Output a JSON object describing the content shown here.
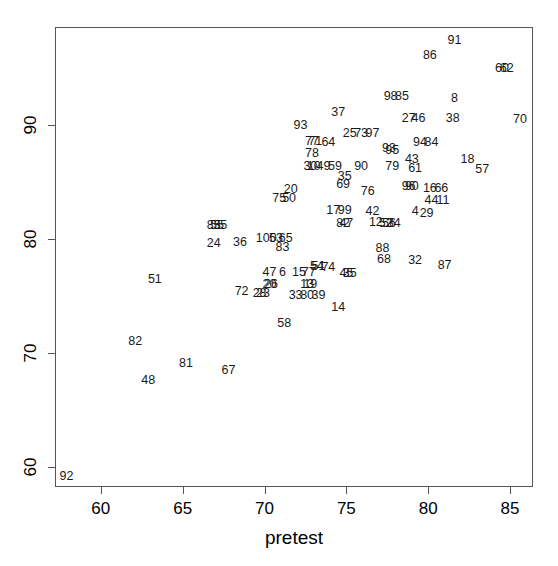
{
  "chart_data": {
    "type": "scatter",
    "title": "",
    "subtitle": "",
    "xlabel": "pretest",
    "ylabel": "",
    "xlim": [
      57.2,
      86.4
    ],
    "ylim": [
      58.2,
      98.6
    ],
    "xticks": [
      60,
      65,
      70,
      75,
      80,
      85
    ],
    "yticks": [
      60,
      70,
      80,
      90
    ],
    "grid": false,
    "legend": null,
    "point_style": "text-labels",
    "annotation_note": "Each data point is drawn as its case-number label rather than a plotting symbol; several labels overlap where points coincide.",
    "points": [
      {
        "label": "91",
        "x": 81.6,
        "y": 97.5
      },
      {
        "label": "86",
        "x": 80.1,
        "y": 96.1
      },
      {
        "label": "60",
        "x": 84.5,
        "y": 95.0
      },
      {
        "label": "62",
        "x": 84.8,
        "y": 95.0
      },
      {
        "label": "98",
        "x": 77.7,
        "y": 92.5
      },
      {
        "label": "85",
        "x": 78.4,
        "y": 92.5
      },
      {
        "label": "8",
        "x": 81.6,
        "y": 92.4
      },
      {
        "label": "27",
        "x": 78.8,
        "y": 90.6
      },
      {
        "label": "46",
        "x": 79.4,
        "y": 90.6
      },
      {
        "label": "38",
        "x": 81.5,
        "y": 90.6
      },
      {
        "label": "70",
        "x": 85.6,
        "y": 90.5
      },
      {
        "label": "37",
        "x": 74.5,
        "y": 91.1
      },
      {
        "label": "93",
        "x": 72.2,
        "y": 90.0
      },
      {
        "label": "25",
        "x": 75.2,
        "y": 89.3
      },
      {
        "label": "73",
        "x": 75.9,
        "y": 89.3
      },
      {
        "label": "97",
        "x": 76.6,
        "y": 89.3
      },
      {
        "label": "94",
        "x": 79.5,
        "y": 88.5
      },
      {
        "label": "84",
        "x": 80.2,
        "y": 88.5
      },
      {
        "label": "64",
        "x": 73.9,
        "y": 88.5
      },
      {
        "label": "77",
        "x": 72.9,
        "y": 88.6
      },
      {
        "label": "71",
        "x": 73.1,
        "y": 88.6
      },
      {
        "label": "93b",
        "x": 77.6,
        "y": 88.0
      },
      {
        "label": "95",
        "x": 77.8,
        "y": 87.8
      },
      {
        "label": "78",
        "x": 72.9,
        "y": 87.5
      },
      {
        "label": "43",
        "x": 79.0,
        "y": 87.0
      },
      {
        "label": "18",
        "x": 82.4,
        "y": 87.0
      },
      {
        "label": "30",
        "x": 72.8,
        "y": 86.4
      },
      {
        "label": "10",
        "x": 73.0,
        "y": 86.4
      },
      {
        "label": "49",
        "x": 73.6,
        "y": 86.4
      },
      {
        "label": "59",
        "x": 74.3,
        "y": 86.4
      },
      {
        "label": "90",
        "x": 75.9,
        "y": 86.4
      },
      {
        "label": "79",
        "x": 77.8,
        "y": 86.4
      },
      {
        "label": "61",
        "x": 79.2,
        "y": 86.2
      },
      {
        "label": "57",
        "x": 83.3,
        "y": 86.1
      },
      {
        "label": "35",
        "x": 74.9,
        "y": 85.5
      },
      {
        "label": "69",
        "x": 74.8,
        "y": 84.8
      },
      {
        "label": "96",
        "x": 78.8,
        "y": 84.6
      },
      {
        "label": "90b",
        "x": 79.0,
        "y": 84.6
      },
      {
        "label": "16",
        "x": 80.1,
        "y": 84.5
      },
      {
        "label": "66",
        "x": 80.8,
        "y": 84.5
      },
      {
        "label": "20",
        "x": 71.6,
        "y": 84.4
      },
      {
        "label": "76",
        "x": 76.3,
        "y": 84.2
      },
      {
        "label": "75",
        "x": 70.9,
        "y": 83.6
      },
      {
        "label": "50",
        "x": 71.5,
        "y": 83.6
      },
      {
        "label": "44",
        "x": 80.2,
        "y": 83.4
      },
      {
        "label": "11",
        "x": 80.9,
        "y": 83.4
      },
      {
        "label": "17",
        "x": 74.2,
        "y": 82.5
      },
      {
        "label": "99",
        "x": 74.9,
        "y": 82.5
      },
      {
        "label": "42",
        "x": 76.6,
        "y": 82.4
      },
      {
        "label": "4",
        "x": 79.2,
        "y": 82.4
      },
      {
        "label": "29",
        "x": 79.9,
        "y": 82.3
      },
      {
        "label": "85b",
        "x": 66.9,
        "y": 81.2
      },
      {
        "label": "55",
        "x": 67.1,
        "y": 81.2
      },
      {
        "label": "35b",
        "x": 67.3,
        "y": 81.2
      },
      {
        "label": "12",
        "x": 76.8,
        "y": 81.5
      },
      {
        "label": "52",
        "x": 77.4,
        "y": 81.4
      },
      {
        "label": "56",
        "x": 77.6,
        "y": 81.4
      },
      {
        "label": "34",
        "x": 77.9,
        "y": 81.4
      },
      {
        "label": "82b",
        "x": 74.8,
        "y": 81.4
      },
      {
        "label": "47b",
        "x": 75.0,
        "y": 81.4
      },
      {
        "label": "100",
        "x": 70.1,
        "y": 80.1
      },
      {
        "label": "53",
        "x": 70.7,
        "y": 80.1
      },
      {
        "label": "65",
        "x": 71.3,
        "y": 80.1
      },
      {
        "label": "36",
        "x": 68.5,
        "y": 79.7
      },
      {
        "label": "24",
        "x": 66.9,
        "y": 79.6
      },
      {
        "label": "83",
        "x": 71.1,
        "y": 79.3
      },
      {
        "label": "88",
        "x": 77.2,
        "y": 79.2
      },
      {
        "label": "68",
        "x": 77.3,
        "y": 78.2
      },
      {
        "label": "32",
        "x": 79.2,
        "y": 78.1
      },
      {
        "label": "87",
        "x": 81.0,
        "y": 77.7
      },
      {
        "label": "54",
        "x": 73.2,
        "y": 77.6
      },
      {
        "label": "51b",
        "x": 73.3,
        "y": 77.6
      },
      {
        "label": "74",
        "x": 73.9,
        "y": 77.5
      },
      {
        "label": "47",
        "x": 70.3,
        "y": 77.1
      },
      {
        "label": "6",
        "x": 71.1,
        "y": 77.1
      },
      {
        "label": "15",
        "x": 72.1,
        "y": 77.1
      },
      {
        "label": "77b",
        "x": 72.7,
        "y": 77.1
      },
      {
        "label": "45",
        "x": 75.0,
        "y": 77.0
      },
      {
        "label": "35c",
        "x": 75.2,
        "y": 77.0
      },
      {
        "label": "20b",
        "x": 70.3,
        "y": 76.0
      },
      {
        "label": "26",
        "x": 70.4,
        "y": 76.0
      },
      {
        "label": "13",
        "x": 72.6,
        "y": 76.0
      },
      {
        "label": "19",
        "x": 72.8,
        "y": 76.0
      },
      {
        "label": "28",
        "x": 69.7,
        "y": 75.2
      },
      {
        "label": "23",
        "x": 69.9,
        "y": 75.2
      },
      {
        "label": "33",
        "x": 71.9,
        "y": 75.1
      },
      {
        "label": "80",
        "x": 72.6,
        "y": 75.1
      },
      {
        "label": "39",
        "x": 73.3,
        "y": 75.1
      },
      {
        "label": "14",
        "x": 74.5,
        "y": 74.0
      },
      {
        "label": "58",
        "x": 71.2,
        "y": 72.6
      },
      {
        "label": "51",
        "x": 63.3,
        "y": 76.5
      },
      {
        "label": "72",
        "x": 68.6,
        "y": 75.4
      },
      {
        "label": "82",
        "x": 62.1,
        "y": 71.0
      },
      {
        "label": "81",
        "x": 65.2,
        "y": 69.1
      },
      {
        "label": "67",
        "x": 67.8,
        "y": 68.5
      },
      {
        "label": "48",
        "x": 62.9,
        "y": 67.6
      },
      {
        "label": "92",
        "x": 57.9,
        "y": 59.2
      }
    ]
  },
  "axes": {
    "x_axis_name": "x-axis",
    "y_axis_name": "y-axis",
    "xlabel": "pretest",
    "xticks": [
      "60",
      "65",
      "70",
      "75",
      "80",
      "85"
    ],
    "yticks": [
      "60",
      "70",
      "80",
      "90"
    ]
  },
  "plot_geometry": {
    "box_left_px": 55,
    "box_top_px": 27,
    "box_width_px": 478,
    "box_height_px": 460,
    "x_data_min": 57.2,
    "x_data_max": 86.4,
    "y_data_min": 58.2,
    "y_data_max": 98.6
  }
}
